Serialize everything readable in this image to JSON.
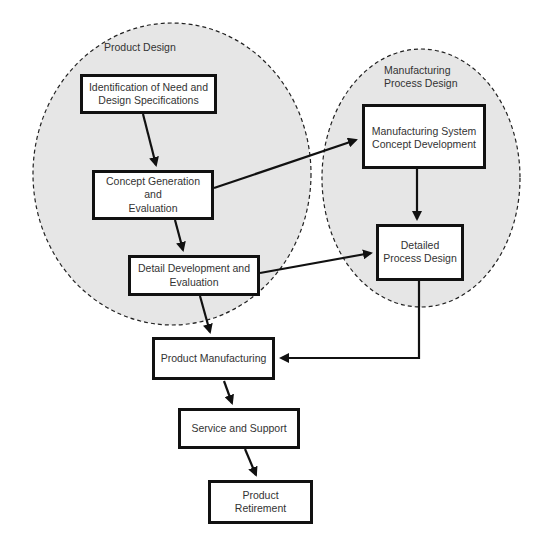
{
  "groups": {
    "product_design": {
      "label": "Product Design"
    },
    "manufacturing_process_design": {
      "label_line1": "Manufacturing",
      "label_line2": "Process Design"
    }
  },
  "nodes": {
    "identification": {
      "line1": "Identification of Need and",
      "line2": "Design Specifications"
    },
    "concept_generation": {
      "line1": "Concept Generation and",
      "line2": "Evaluation"
    },
    "detail_development": {
      "line1": "Detail Development and",
      "line2": "Evaluation"
    },
    "mfg_system_concept": {
      "line1": "Manufacturing System",
      "line2": "Concept Development"
    },
    "detailed_process_design": {
      "line1": "Detailed",
      "line2": "Process Design"
    },
    "product_manufacturing": {
      "line1": "Product Manufacturing"
    },
    "service_support": {
      "line1": "Service and Support"
    },
    "product_retirement": {
      "line1": "Product",
      "line2": "Retirement"
    }
  },
  "edges": [
    {
      "from": "identification",
      "to": "concept_generation"
    },
    {
      "from": "concept_generation",
      "to": "detail_development"
    },
    {
      "from": "concept_generation",
      "to": "mfg_system_concept"
    },
    {
      "from": "mfg_system_concept",
      "to": "detailed_process_design"
    },
    {
      "from": "detail_development",
      "to": "detailed_process_design"
    },
    {
      "from": "detail_development",
      "to": "product_manufacturing"
    },
    {
      "from": "detailed_process_design",
      "to": "product_manufacturing"
    },
    {
      "from": "product_manufacturing",
      "to": "service_support"
    },
    {
      "from": "service_support",
      "to": "product_retirement"
    }
  ],
  "colors": {
    "group_fill": "#e6e6e6",
    "group_stroke": "#222222",
    "box_border": "#111111",
    "arrow": "#111111"
  }
}
